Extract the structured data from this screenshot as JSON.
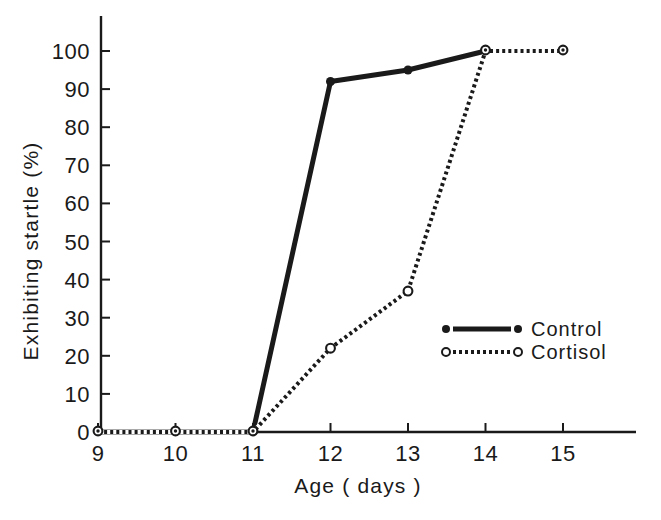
{
  "figure": {
    "background": "#ffffff",
    "ink": "#1a1a1a"
  },
  "chart_data": {
    "type": "line",
    "title": "",
    "xlabel": "Age ( days )",
    "ylabel": "Exhibiting startle (%)",
    "x_ticks": [
      9,
      10,
      11,
      12,
      13,
      14,
      15
    ],
    "x_tick_labels": [
      "9",
      "10",
      "11",
      "12",
      "13",
      "14",
      "15"
    ],
    "y_ticks": [
      0,
      10,
      20,
      30,
      40,
      50,
      60,
      70,
      80,
      90,
      100
    ],
    "y_tick_labels": [
      "0",
      "10",
      "20",
      "30",
      "40",
      "50",
      "60",
      "70",
      "80",
      "90",
      "100"
    ],
    "xlim": [
      9,
      15.95
    ],
    "ylim": [
      0,
      100
    ],
    "grid": false,
    "legend_position": "inside-right-middle",
    "series": [
      {
        "name": "Control",
        "line_style": "solid",
        "marker": "filled-circle",
        "x": [
          9,
          10,
          11,
          12,
          13,
          14
        ],
        "values": [
          0,
          0,
          0,
          92,
          95,
          100
        ]
      },
      {
        "name": "Cortisol",
        "line_style": "dotted",
        "marker": "open-circle",
        "x": [
          9,
          10,
          11,
          12,
          13,
          14,
          15
        ],
        "values": [
          0,
          0,
          0,
          22,
          37,
          100,
          100
        ]
      }
    ],
    "overlapping_marker_x": [
      9,
      10,
      11,
      14,
      15
    ]
  }
}
